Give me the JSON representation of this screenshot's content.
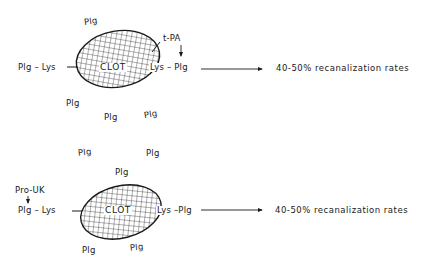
{
  "figure": {
    "panels": [
      {
        "id": "tpa",
        "clot_label": "CLOT",
        "agent": "t-PA",
        "left_binding": "Plg – Lys",
        "right_binding": "Lys – Plg",
        "free_plg": [
          "Plg",
          "Plg",
          "Plg",
          "Plg"
        ],
        "result": "40-50% recanalization rates"
      },
      {
        "id": "prouk",
        "clot_label": "CLOT",
        "agent": "Pro-UK",
        "left_binding": "Plg – Lys",
        "right_binding": "Lys –Plg",
        "free_plg": [
          "Plg",
          "Plg",
          "Plg",
          "Plg",
          "Plg"
        ],
        "result": "40-50% recanalization rates"
      }
    ],
    "colors": {
      "ink": "#1a1a1a",
      "background": "#ffffff"
    }
  }
}
